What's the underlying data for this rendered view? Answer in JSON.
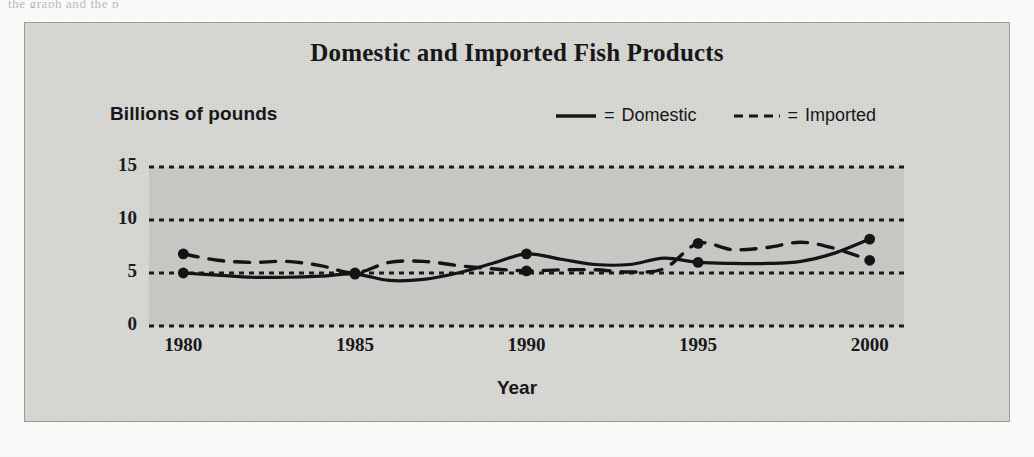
{
  "page": {
    "cropped_top_text": "the graph and the p"
  },
  "figure": {
    "title": "Domestic and Imported Fish Products",
    "y_axis_title": "Billions of pounds",
    "x_axis_title": "Year",
    "legend": [
      {
        "name": "legend-domestic",
        "style": "solid",
        "equals": "=",
        "label": "Domestic"
      },
      {
        "name": "legend-imported",
        "style": "dashed",
        "equals": "=",
        "label": "Imported"
      }
    ],
    "colors": {
      "panel_background": "#d8d8d4",
      "plot_background": "#c2c2bd",
      "ink": "#17171a",
      "gridline": "#1a1a1c",
      "series_line": "#141416"
    }
  },
  "chart_data": {
    "type": "line",
    "title": "Domestic and Imported Fish Products",
    "xlabel": "Year",
    "ylabel": "Billions of pounds",
    "xlim": [
      1979,
      2001
    ],
    "ylim": [
      0,
      15
    ],
    "xticks": [
      1980,
      1985,
      1990,
      1995,
      2000
    ],
    "yticks": [
      0,
      5,
      10,
      15
    ],
    "grid": true,
    "legend_position": "top-right",
    "marked_years": [
      1980,
      1985,
      1990,
      1995,
      2000
    ],
    "x": [
      1980,
      1981,
      1982,
      1983,
      1984,
      1985,
      1986,
      1987,
      1988,
      1989,
      1990,
      1991,
      1992,
      1993,
      1994,
      1995,
      1996,
      1997,
      1998,
      1999,
      2000
    ],
    "series": [
      {
        "name": "Domestic",
        "style": "solid",
        "values": [
          5.0,
          4.8,
          4.6,
          4.6,
          4.7,
          4.9,
          4.3,
          4.4,
          5.0,
          5.9,
          6.8,
          6.3,
          5.8,
          5.8,
          6.4,
          6.0,
          5.9,
          5.9,
          6.1,
          6.9,
          8.2
        ]
      },
      {
        "name": "Imported",
        "style": "dashed",
        "values": [
          6.8,
          6.2,
          6.0,
          6.1,
          5.7,
          5.0,
          6.0,
          6.1,
          5.7,
          5.4,
          5.2,
          5.3,
          5.3,
          5.1,
          5.4,
          7.8,
          7.2,
          7.4,
          7.9,
          7.3,
          6.2
        ]
      }
    ]
  }
}
